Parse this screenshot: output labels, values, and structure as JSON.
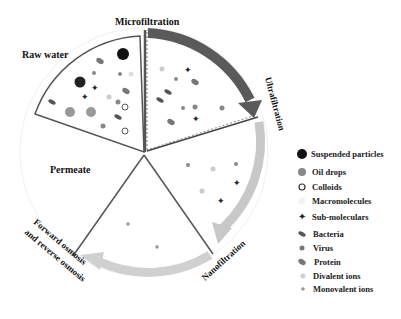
{
  "diagram": {
    "stages": {
      "raw_water": "Raw water",
      "microfiltration": "Microfiltration",
      "ultrafiltration": "Ultrafiltration",
      "nanofiltration": "Nanofiltration",
      "fo_ro_line1": "Forward osmosis",
      "fo_ro_line2": "and reverse osmosis",
      "permeate": "Permeate"
    },
    "legend": [
      {
        "label": "Suspended particles",
        "icon": "large-black-circle"
      },
      {
        "label": "Oil drops",
        "icon": "grey-circle"
      },
      {
        "label": "Colloids",
        "icon": "hollow-circle"
      },
      {
        "label": "Macromolecules",
        "icon": "faint-circle"
      },
      {
        "label": "Sub-moleculars",
        "icon": "four-point-star"
      },
      {
        "label": "Bacteria",
        "icon": "rod-shape"
      },
      {
        "label": "Virus",
        "icon": "small-grey-circle"
      },
      {
        "label": "Protein",
        "icon": "ellipse-with-inner"
      },
      {
        "label": "Divalent ions",
        "icon": "light-dot"
      },
      {
        "label": "Monovalent ions",
        "icon": "tiny-dot"
      }
    ],
    "colors": {
      "dark_arrow": "#555555",
      "light_arrow": "#c8c8c8",
      "wedge_line": "#444444",
      "suspended": "#111111",
      "oil": "#8a8a8a"
    }
  }
}
